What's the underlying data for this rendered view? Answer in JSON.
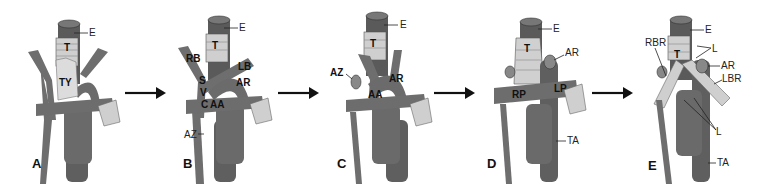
{
  "figure": {
    "panels": [
      {
        "id": "A",
        "letter": "A",
        "labels": {
          "E": "E",
          "T": "T",
          "TY": "TY"
        }
      },
      {
        "id": "B",
        "letter": "B",
        "labels": {
          "E": "E",
          "T": "T",
          "RB": "RB",
          "SVC_S": "S",
          "SVC_V": "V",
          "SVC_C": "C",
          "LB": "LB",
          "AR": "AR",
          "AA": "AA",
          "AZ": "AZ"
        }
      },
      {
        "id": "C",
        "letter": "C",
        "labels": {
          "E": "E",
          "T": "T",
          "AZ": "AZ",
          "AR": "AR",
          "AA": "AA"
        }
      },
      {
        "id": "D",
        "letter": "D",
        "labels": {
          "E": "E",
          "T": "T",
          "AR": "AR",
          "RP": "RP",
          "LP": "LP",
          "TA": "TA"
        }
      },
      {
        "id": "E",
        "letter": "E",
        "labels": {
          "E": "E",
          "T": "T",
          "RBR": "RBR",
          "L_top": "L",
          "AR": "AR",
          "LBR": "LBR",
          "L_bottom": "L",
          "TA": "TA"
        }
      }
    ],
    "arrows": [
      "A-to-B",
      "B-to-C",
      "C-to-D",
      "D-to-E"
    ],
    "colors": {
      "vessel": "#6b6b6b",
      "vessel_dark": "#4a4a4a",
      "vessel_light": "#8a8a8a",
      "trachea": "#c8c8c8",
      "thymus": "#d8d8d8",
      "esophagus": "#555555",
      "arrow": "#111111"
    }
  }
}
